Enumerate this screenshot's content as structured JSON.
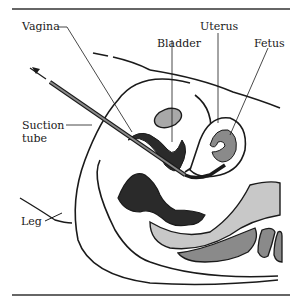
{
  "figure": {
    "type": "anatomical-illustration",
    "labels": {
      "vagina": "Vagina",
      "bladder": "Bladder",
      "uterus": "Uterus",
      "fetus": "Fetus",
      "suction_tube_line1": "Suction",
      "suction_tube_line2": "tube",
      "leg": "Leg"
    },
    "colors": {
      "outline": "#1a1a1a",
      "dark_tissue": "#2a2a2a",
      "mid_gray": "#8a8a8a",
      "light_gray": "#c8c8c8",
      "background": "#ffffff"
    }
  }
}
